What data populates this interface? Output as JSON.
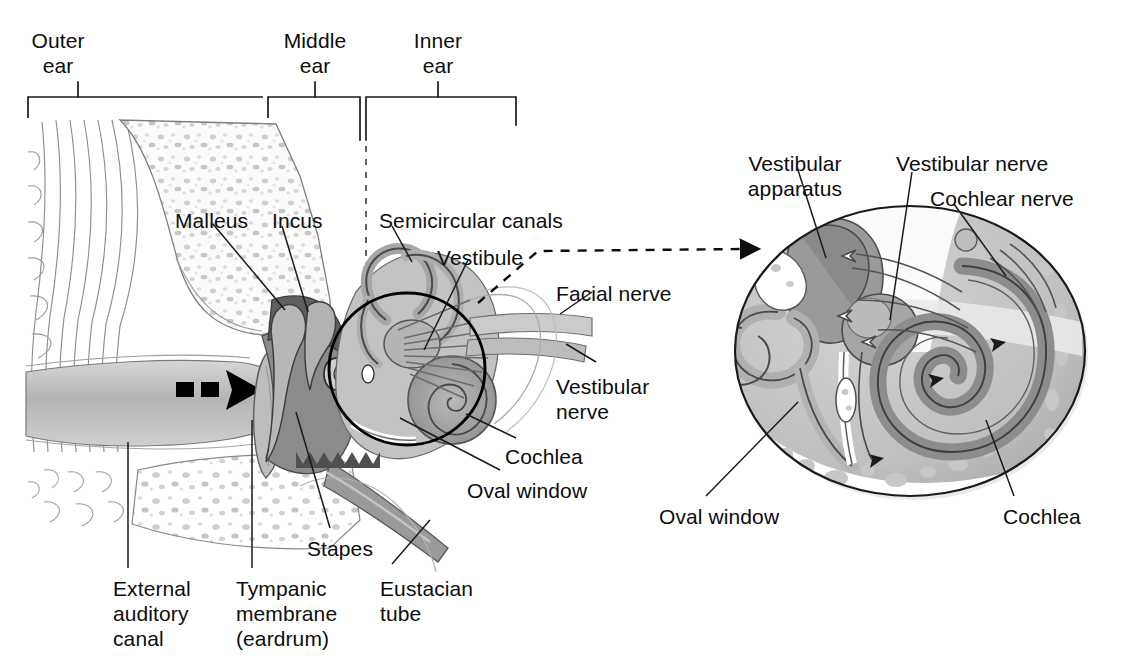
{
  "figure": {
    "palette": {
      "ink": "#0d0d0d",
      "outline": "#555555",
      "bone_light": "#f4f4f4",
      "tissue_light": "#c9c9c9",
      "tissue_mid": "#a8a8a8",
      "tissue_dark": "#7d7d7d",
      "tissue_darkest": "#5a5a5a",
      "canal_gray": "#bdbdbd",
      "white": "#ffffff"
    }
  },
  "regions": {
    "brackets": [
      {
        "id": "outer",
        "label": "Outer\near",
        "label_x": 58,
        "label_y": 28,
        "tick_x": 78,
        "bar_x1": 28,
        "bar_x2": 262
      },
      {
        "id": "middle",
        "label": "Middle\near",
        "label_x": 315,
        "label_y": 28,
        "tick_x": 315,
        "bar_x1": 268,
        "bar_x2": 360
      },
      {
        "id": "inner",
        "label": "Inner\near",
        "label_x": 438,
        "label_y": 28,
        "tick_x": 438,
        "bar_x1": 366,
        "bar_x2": 516
      }
    ],
    "bar_y": 97
  },
  "main_labels": [
    {
      "id": "malleus",
      "text": "Malleus",
      "x": 175,
      "y": 208,
      "align": "left"
    },
    {
      "id": "incus",
      "text": "Incus",
      "x": 272,
      "y": 208,
      "align": "left"
    },
    {
      "id": "semicircular-canals",
      "text": "Semicircular canals",
      "x": 379,
      "y": 208,
      "align": "left"
    },
    {
      "id": "vestibule",
      "text": "Vestibule",
      "x": 437,
      "y": 245,
      "align": "left"
    },
    {
      "id": "facial-nerve",
      "text": "Facial nerve",
      "x": 556,
      "y": 281,
      "align": "left"
    },
    {
      "id": "vestibular-nerve",
      "text": "Vestibular\nnerve",
      "x": 556,
      "y": 374,
      "align": "left"
    },
    {
      "id": "cochlea",
      "text": "Cochlea",
      "x": 505,
      "y": 444,
      "align": "left"
    },
    {
      "id": "oval-window",
      "text": "Oval window",
      "x": 467,
      "y": 478,
      "align": "left"
    },
    {
      "id": "stapes",
      "text": "Stapes",
      "x": 307,
      "y": 536,
      "align": "left"
    },
    {
      "id": "external-auditory-canal",
      "text": "External\nauditory\ncanal",
      "x": 113,
      "y": 576,
      "align": "left"
    },
    {
      "id": "tympanic-membrane",
      "text": "Tympanic\nmembrane\n(eardrum)",
      "x": 236,
      "y": 576,
      "align": "left"
    },
    {
      "id": "eustacian-tube",
      "text": "Eustacian\ntube",
      "x": 380,
      "y": 576,
      "align": "left"
    }
  ],
  "detail_labels": [
    {
      "id": "vestibular-apparatus",
      "text": "Vestibular\napparatus",
      "x": 795,
      "y": 151,
      "align": "center"
    },
    {
      "id": "detail-vestibular-nerve",
      "text": "Vestibular nerve",
      "x": 896,
      "y": 151,
      "align": "left"
    },
    {
      "id": "cochlear-nerve",
      "text": "Cochlear nerve",
      "x": 930,
      "y": 186,
      "align": "left"
    },
    {
      "id": "detail-oval-window",
      "text": "Oval window",
      "x": 659,
      "y": 504,
      "align": "left"
    },
    {
      "id": "detail-cochlea",
      "text": "Cochlea",
      "x": 1003,
      "y": 504,
      "align": "left"
    }
  ],
  "annotations": {
    "sound_arrow": {
      "name": "sound-direction-arrow",
      "description": "dashed black arrow entering the external auditory canal"
    },
    "callout_circle": {
      "name": "magnified-region-circle",
      "cx": 407,
      "cy": 369,
      "rx": 79,
      "ry": 77
    },
    "callout_connector": {
      "name": "magnification-connector-arrow",
      "style": "dashed-with-arrowhead"
    },
    "detail_circle": {
      "name": "magnified-inner-ear-view",
      "cx": 910,
      "cy": 351,
      "rx": 176,
      "ry": 146
    }
  }
}
